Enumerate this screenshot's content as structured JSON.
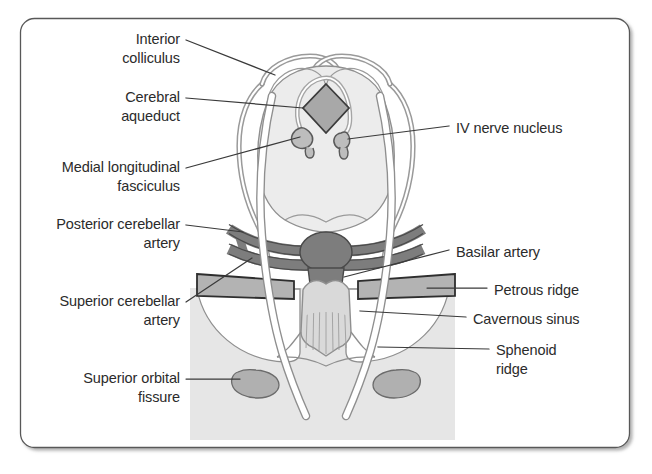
{
  "figure": {
    "title_visible": false,
    "type": "anatomical-diagram",
    "frame": {
      "border_color": "#595959",
      "corner_radius": 14,
      "shadow": true
    },
    "palette": {
      "background": "#ffffff",
      "skull_base_shade": "#e6e6e6",
      "brain_fill": "#ececec",
      "brain_outline": "#8f8f8f",
      "artery_fill": "#7d7d7d",
      "artery_outline": "#4a4a4a",
      "ridge_fill": "#b3b3b3",
      "ridge_outline": "#2e2e2e",
      "aqueduct_fill": "#a8a8a8",
      "nucleus_fill": "#bdbdbd",
      "leader_line": "#3a3a3a",
      "text": "#2b2b2b"
    }
  },
  "labels_left": [
    {
      "id": "interior-colliculus",
      "lines": [
        "Interior",
        "colliculus"
      ],
      "x": 88,
      "y": 30,
      "width": 92
    },
    {
      "id": "cerebral-aqueduct",
      "lines": [
        "Cerebral",
        "aqueduct"
      ],
      "x": 88,
      "y": 88,
      "width": 92
    },
    {
      "id": "medial-longitudinal-fasciculus",
      "lines": [
        "Medial longitudinal",
        "fasciculus"
      ],
      "x": 33,
      "y": 158,
      "width": 147
    },
    {
      "id": "posterior-cerebellar-artery",
      "lines": [
        "Posterior cerebellar",
        "artery"
      ],
      "x": 26,
      "y": 215,
      "width": 154
    },
    {
      "id": "superior-cerebellar-artery",
      "lines": [
        "Superior cerebellar",
        "artery"
      ],
      "x": 34,
      "y": 292,
      "width": 146
    },
    {
      "id": "superior-orbital-fissure",
      "lines": [
        "Superior orbital",
        "fissure"
      ],
      "x": 52,
      "y": 369,
      "width": 128
    }
  ],
  "labels_right": [
    {
      "id": "iv-nerve-nucleus",
      "lines": [
        "IV nerve nucleus"
      ],
      "x": 456,
      "y": 119
    },
    {
      "id": "basilar-artery",
      "lines": [
        "Basilar artery"
      ],
      "x": 456,
      "y": 243
    },
    {
      "id": "petrous-ridge",
      "lines": [
        "Petrous ridge"
      ],
      "x": 494,
      "y": 281
    },
    {
      "id": "cavernous-sinus",
      "lines": [
        "Cavernous sinus"
      ],
      "x": 473,
      "y": 310
    },
    {
      "id": "sphenoid-ridge",
      "lines": [
        "Sphenoid",
        "ridge"
      ],
      "x": 496,
      "y": 341
    }
  ]
}
